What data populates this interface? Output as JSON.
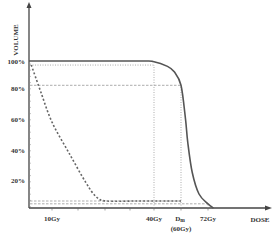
{
  "chart_data": {
    "type": "line",
    "title": "",
    "xlabel": "DOSE",
    "ylabel": "VOLUME",
    "x_unit": "Gy",
    "y_unit": "%",
    "ylim": [
      0,
      100
    ],
    "xlim": [
      0,
      80
    ],
    "grid": false,
    "legend": "none",
    "y_ticks": [
      {
        "value": 100,
        "label": "100%"
      },
      {
        "value": 80,
        "label": "80%"
      },
      {
        "value": 60,
        "label": "60%"
      },
      {
        "value": 40,
        "label": "40%"
      },
      {
        "value": 20,
        "label": "20%"
      }
    ],
    "x_ticks": [
      {
        "value": 10,
        "label": "10Gy"
      },
      {
        "value": 40,
        "label": "40Gy"
      },
      {
        "value": 60,
        "label": "Dm",
        "sub_label": "(60Gy)"
      },
      {
        "value": 72,
        "label": "72Gy"
      }
    ],
    "series": [
      {
        "name": "solid-dvh",
        "style": "solid",
        "color": "#555555",
        "points": [
          [
            0,
            100
          ],
          [
            35,
            100
          ],
          [
            40,
            99.5
          ],
          [
            50,
            96
          ],
          [
            55,
            92
          ],
          [
            60,
            82
          ],
          [
            62,
            60
          ],
          [
            63,
            45
          ],
          [
            65,
            25
          ],
          [
            68,
            10
          ],
          [
            72,
            3
          ],
          [
            74,
            0
          ]
        ]
      },
      {
        "name": "dashed-dvh",
        "style": "dashed",
        "color": "#666666",
        "points": [
          [
            1,
            97
          ],
          [
            5,
            78
          ],
          [
            10,
            58
          ],
          [
            15,
            38
          ],
          [
            20,
            18
          ],
          [
            23,
            8
          ],
          [
            26,
            5
          ],
          [
            35,
            5
          ],
          [
            50,
            5
          ],
          [
            60,
            5
          ]
        ]
      }
    ],
    "reference_lines": [
      {
        "orientation": "h",
        "y": 97,
        "x_from": 0,
        "x_to": 40,
        "style": "dotted"
      },
      {
        "orientation": "h",
        "y": 82,
        "x_from": 0,
        "x_to": 60,
        "style": "dashed"
      },
      {
        "orientation": "h",
        "y": 5,
        "x_from": 0,
        "x_to": 60,
        "style": "dashed"
      },
      {
        "orientation": "h",
        "y": 3,
        "x_from": 0,
        "x_to": 72,
        "style": "dashed"
      },
      {
        "orientation": "v",
        "x": 40,
        "y_from": 0,
        "y_to": 97,
        "style": "dotted"
      },
      {
        "orientation": "v",
        "x": 60,
        "y_from": 0,
        "y_to": 82,
        "style": "dotted"
      },
      {
        "orientation": "v",
        "x": 72,
        "y_from": 0,
        "y_to": 3,
        "style": "dotted"
      }
    ]
  }
}
